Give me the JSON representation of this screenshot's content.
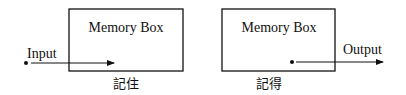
{
  "diagram": {
    "left": {
      "box_label": "Memory Box",
      "input_label": "Input",
      "caption": "記住"
    },
    "right": {
      "box_label": "Memory Box",
      "output_label": "Output",
      "caption": "記得"
    }
  }
}
